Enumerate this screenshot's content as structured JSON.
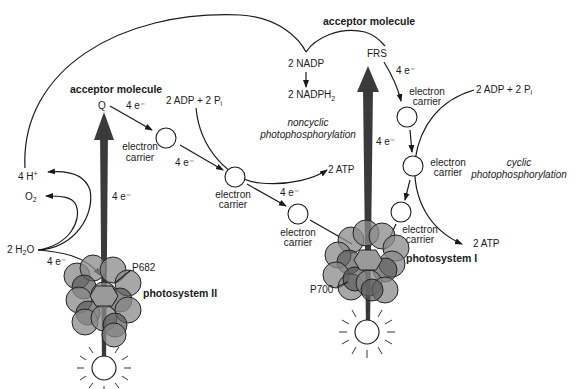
{
  "diagram": {
    "labels": {
      "acceptor_left": "acceptor molecule",
      "acceptor_right": "acceptor molecule",
      "q": "Q",
      "frs": "FRS",
      "nadp": "2 NADP",
      "nadph": "2 NADPH",
      "nadph_sub": "2",
      "adp_left": "2 ADP + 2 P",
      "adp_left_sub": "i",
      "adp_right": "2 ADP + 2 P",
      "adp_right_sub": "i",
      "atp_left": "2 ATP",
      "atp_right": "2 ATP",
      "noncyclic_1": "noncyclic",
      "noncyclic_2": "photophosphorylation",
      "cyclic_1": "cyclic",
      "cyclic_2": "photophosphorylation",
      "h_plus": "4 H",
      "h_plus_sup": "+",
      "o2": "O",
      "o2_sub": "2",
      "h2o_pre": "2 H",
      "h2o_sub": "2",
      "h2o_post": "O",
      "p682": "P682",
      "p700": "P700",
      "ps2": "photosystem II",
      "ps1": "photosystem I",
      "electron_carrier_1": "electron",
      "electron_carrier_2": "carrier",
      "e_q": "4 e⁻",
      "e_c1": "4 e⁻",
      "e_c2": "4 e⁻",
      "e_ps2_up": "4 e⁻",
      "e_water": "4 e⁻",
      "e_frs": "4 e⁻",
      "e_ps1_up": "4 e⁻"
    },
    "icons": {
      "sun_left": "sunlight-icon",
      "sun_right": "sunlight-icon",
      "ps2_cluster": "pigment-cluster-icon",
      "ps1_cluster": "pigment-cluster-icon"
    },
    "colors": {
      "ink": "#1a1a1a",
      "pigment": "#8a8a8a",
      "pigment_dark": "#5a5a5a",
      "arrow": "#3a3a3a",
      "background": "#ffffff"
    }
  }
}
